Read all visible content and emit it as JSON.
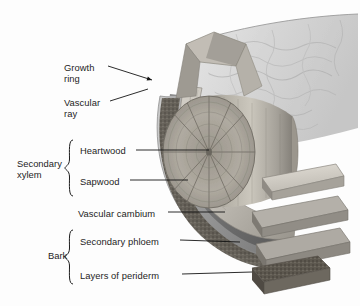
{
  "figure": {
    "kind": "woody-stem-cutaway-diagram",
    "palette": {
      "background": "#fdfdfd",
      "leader_line": "#141414",
      "text": "#1d1d1d",
      "bark_outer": "#d8d8d8",
      "bark_outer_shadow": "#b4b4b4",
      "periderm_dark": "#6e6a63",
      "periderm_speckle": "#4a463f",
      "phloem": "#9a9a9a",
      "cambium": "#7f7f7f",
      "sapwood": "#c4c0b8",
      "heartwood": "#a9a49b",
      "inner_cylinder": "#b9b5ad",
      "cut_face": "#8e8a82",
      "slab_top": "#cfcbc3",
      "slab_edge": "#8a8680"
    },
    "labels": [
      {
        "id": "growth-ring",
        "text": "Growth\nring",
        "x": 64,
        "y": 62,
        "lines": 2
      },
      {
        "id": "vascular-ray",
        "text": "Vascular\nray",
        "x": 64,
        "y": 97,
        "lines": 2
      },
      {
        "id": "heartwood",
        "text": "Heartwood",
        "x": 80,
        "y": 145,
        "lines": 1
      },
      {
        "id": "sapwood",
        "text": "Sapwood",
        "x": 80,
        "y": 176,
        "lines": 1
      },
      {
        "id": "vascular-cambium",
        "text": "Vascular cambium",
        "x": 78,
        "y": 208,
        "lines": 1
      },
      {
        "id": "secondary-phloem",
        "text": "Secondary phloem",
        "x": 80,
        "y": 236,
        "lines": 1
      },
      {
        "id": "layers-periderm",
        "text": "Layers of periderm",
        "x": 80,
        "y": 270,
        "lines": 1
      }
    ],
    "groups": [
      {
        "id": "secondary-xylem",
        "text": "Secondary\nxylem",
        "x": 17,
        "y": 158,
        "brace_x": 68,
        "brace_y": 140,
        "brace_h": 56
      },
      {
        "id": "bark",
        "text": "Bark",
        "x": 48,
        "y": 250,
        "brace_x": 68,
        "brace_y": 230,
        "brace_h": 52
      }
    ],
    "leaders": [
      {
        "id": "growth-ring-leader",
        "from": [
          108,
          66
        ],
        "to": [
          152,
          80
        ],
        "arrow": true
      },
      {
        "id": "vascular-ray-leader",
        "from": [
          110,
          101
        ],
        "to": [
          148,
          89
        ],
        "arrow": false
      },
      {
        "id": "heartwood-leader",
        "from": [
          136,
          150
        ],
        "to": [
          209,
          150
        ],
        "arrow": false
      },
      {
        "id": "sapwood-leader",
        "from": [
          130,
          180
        ],
        "to": [
          188,
          180
        ],
        "arrow": false
      },
      {
        "id": "vascular-cambium-leader",
        "from": [
          168,
          212
        ],
        "to": [
          225,
          212
        ],
        "arrow": false
      },
      {
        "id": "secondary-phloem-leader",
        "from": [
          180,
          240
        ],
        "to": [
          240,
          242
        ],
        "arrow": false
      },
      {
        "id": "layers-periderm-leader",
        "from": [
          182,
          274
        ],
        "to": [
          252,
          272
        ],
        "arrow": false
      }
    ]
  }
}
